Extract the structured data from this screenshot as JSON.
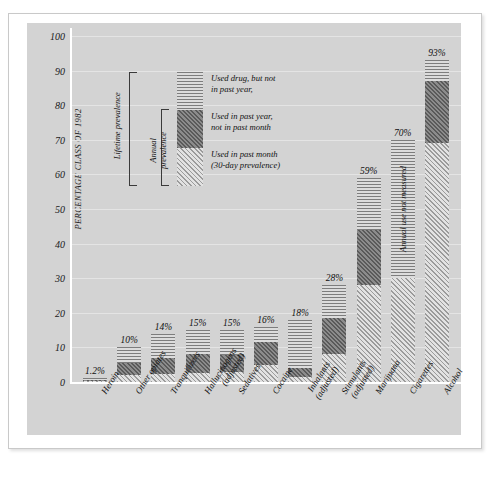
{
  "chart_data": {
    "type": "bar",
    "subtype": "stacked",
    "title": "",
    "xlabel": "",
    "ylabel": "PERCENTAGE CLASS OF 1982",
    "ylim": [
      0,
      100
    ],
    "yticks": [
      0,
      10,
      20,
      30,
      40,
      50,
      60,
      70,
      80,
      90,
      100
    ],
    "grid": true,
    "legend_position": "inside-top-left",
    "categories": [
      "Heroin",
      "Other opiates",
      "Tranquilizers",
      "Hallucinogens (adjusted)",
      "Sedatives",
      "Cocaine",
      "Inhalants (adjusted)",
      "Stimulants (adjusted)",
      "Marijuana",
      "Cigarettes",
      "Alcohol"
    ],
    "series": [
      {
        "name": "Used in past month (30-day prevalence)",
        "pattern": "light-diagonal",
        "values": [
          0.2,
          2.0,
          2.4,
          2.5,
          2.8,
          5.0,
          1.5,
          8.0,
          28.0,
          30.0,
          69.0
        ]
      },
      {
        "name": "Used in past year, not in past month",
        "pattern": "dark-crosshatch",
        "values": [
          0.4,
          3.5,
          4.6,
          5.5,
          5.0,
          6.5,
          2.5,
          10.5,
          16.0,
          0.0,
          18.0
        ]
      },
      {
        "name": "Used drug, but not in past year",
        "pattern": "horizontal-lines",
        "values": [
          0.6,
          4.5,
          7.0,
          7.0,
          7.2,
          4.5,
          14.0,
          9.5,
          15.0,
          40.0,
          6.0
        ]
      }
    ],
    "totals": [
      "1.2%",
      "10%",
      "14%",
      "15%",
      "15%",
      "16%",
      "18%",
      "28%",
      "59%",
      "70%",
      "93%"
    ],
    "annotations": [
      {
        "target": "Cigarettes",
        "text": "Annual use not measured"
      }
    ]
  },
  "axis": {
    "y_title": "PERCENTAGE CLASS OF 1982",
    "ticks": [
      "100",
      "90",
      "80",
      "70",
      "60",
      "50",
      "40",
      "30",
      "20",
      "10",
      "0"
    ]
  },
  "categories": [
    {
      "line1": "Heroin",
      "line2": ""
    },
    {
      "line1": "Other opiates",
      "line2": ""
    },
    {
      "line1": "Tranquilizers",
      "line2": ""
    },
    {
      "line1": "Hallucinogens",
      "line2": "(adjusted)"
    },
    {
      "line1": "Sedatives",
      "line2": ""
    },
    {
      "line1": "Cocaine",
      "line2": ""
    },
    {
      "line1": "Inhalants",
      "line2": "(adjusted)"
    },
    {
      "line1": "Stimulants",
      "line2": "(adjusted)"
    },
    {
      "line1": "Marijuana",
      "line2": ""
    },
    {
      "line1": "Cigarettes",
      "line2": ""
    },
    {
      "line1": "Alcohol",
      "line2": ""
    }
  ],
  "values": [
    "1.2%",
    "10%",
    "14%",
    "15%",
    "15%",
    "16%",
    "18%",
    "28%",
    "59%",
    "70%",
    "93%"
  ],
  "legend": {
    "item1_line1": "Used drug, but not",
    "item1_line2": "in past year,",
    "item2_line1": "Used in past year,",
    "item2_line2": "not in past month",
    "item3_line1": "Used in past month",
    "item3_line2": "(30-day prevalence)",
    "bracket_lifetime": "Lifetime prevalence",
    "bracket_annual_l1": "Annual",
    "bracket_annual_l2": "prevalence"
  },
  "bar_note": "Annual use not measured",
  "colors": {
    "plot_background": "#d3d3d3",
    "page_background": "#ffffff",
    "axis": "#ffffff",
    "gridline": "#e4e4e4",
    "text": "#111111",
    "pattern_lifetime": "#7d7d7d",
    "pattern_annual": "#5a5a5a",
    "pattern_month": "#9b9b9b"
  }
}
